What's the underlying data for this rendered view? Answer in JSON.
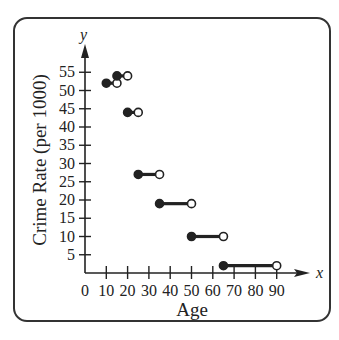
{
  "chart_data": {
    "type": "step",
    "title": "",
    "xlabel": "Age",
    "ylabel": "Crime Rate (per 1000)",
    "x_axis_letter": "x",
    "y_axis_letter": "y",
    "xlim": [
      0,
      90
    ],
    "ylim": [
      0,
      55
    ],
    "x_ticks": [
      0,
      10,
      20,
      30,
      40,
      50,
      60,
      70,
      80,
      90
    ],
    "y_ticks": [
      5,
      10,
      15,
      20,
      25,
      30,
      35,
      40,
      45,
      50,
      55
    ],
    "grid": false,
    "legend": null,
    "segments": [
      {
        "x_start": 10,
        "x_end": 15,
        "y": 52,
        "start_closed": true,
        "end_closed": false
      },
      {
        "x_start": 15,
        "x_end": 20,
        "y": 54,
        "start_closed": true,
        "end_closed": false
      },
      {
        "x_start": 20,
        "x_end": 25,
        "y": 44,
        "start_closed": true,
        "end_closed": false
      },
      {
        "x_start": 25,
        "x_end": 35,
        "y": 27,
        "start_closed": true,
        "end_closed": false
      },
      {
        "x_start": 35,
        "x_end": 50,
        "y": 19,
        "start_closed": true,
        "end_closed": false
      },
      {
        "x_start": 50,
        "x_end": 65,
        "y": 10,
        "start_closed": true,
        "end_closed": false
      },
      {
        "x_start": 65,
        "x_end": 90,
        "y": 2,
        "start_closed": true,
        "end_closed": false
      }
    ]
  },
  "colors": {
    "ink": "#222222",
    "frame": "#333333",
    "background": "#ffffff"
  }
}
